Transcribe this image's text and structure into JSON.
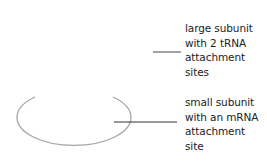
{
  "diagram": {
    "labels": {
      "large_subunit": "large subunit\nwith 2 tRNA\nattachment\nsites",
      "small_subunit": "small subunit\nwith an mRNA\nattachment\nsite"
    },
    "colors": {
      "ellipse": "#a6a6a6",
      "leader_line": "#333333",
      "text": "#222222"
    }
  }
}
